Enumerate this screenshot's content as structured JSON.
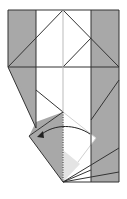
{
  "diagram": {
    "type": "origami-fold-step",
    "description": "Fold the lower-left flap across to the left along the dotted valley line",
    "colors": {
      "background": "#ffffff",
      "paper_colored": "#a8a8a8",
      "paper_white": "#ffffff",
      "paper_light": "#e4e4e4",
      "crease": "#333333",
      "faint_crease": "#bbbbbb",
      "arrow": "#222222"
    },
    "elements": {
      "fold_arrow": "curved arrow pointing left",
      "valley_fold_line": "dotted vertical line at center"
    }
  }
}
